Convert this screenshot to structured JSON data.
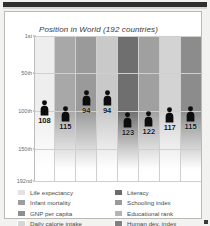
{
  "chart_data": {
    "type": "bar",
    "title": "Position in World (192 countries)",
    "xlabel": "",
    "ylabel": "",
    "ylim": [
      1,
      192
    ],
    "grid": true,
    "legend_position": "bottom",
    "ytick_labels": [
      "1st",
      "50th",
      "100th",
      "150th",
      "192nd"
    ],
    "ytick_values": [
      1,
      50,
      100,
      150,
      192
    ],
    "categories": [
      "Life expectancy",
      "Infant mortality",
      "GNP per capita",
      "Daily calorie intake",
      "Literacy",
      "Schooling index",
      "Educational rank",
      "Human dev. index"
    ],
    "values": [
      108,
      115,
      94,
      94,
      123,
      122,
      117,
      115
    ],
    "value_labels": [
      "108",
      "115",
      "94",
      "94",
      "123",
      "122",
      "117",
      "115"
    ],
    "band_colors": [
      "#eeeeee",
      "#a8a8a8",
      "#9a9a9a",
      "#c9c9c9",
      "#6f6f6f",
      "#a0a0a0",
      "#d3d3d3",
      "#8c8c8c"
    ]
  },
  "header": {
    "title": "Position in World (192 countries)"
  },
  "axis": {
    "ticks": [
      {
        "label": "1st",
        "value": 1
      },
      {
        "label": "50th",
        "value": 50
      },
      {
        "label": "100th",
        "value": 100
      },
      {
        "label": "150th",
        "value": 150
      },
      {
        "label": "192nd",
        "value": 192
      }
    ]
  },
  "series": [
    {
      "label": "Life expectancy",
      "value": 108,
      "value_label": "108",
      "color": "#eeeeee"
    },
    {
      "label": "Infant mortality",
      "value": 115,
      "value_label": "115",
      "color": "#a8a8a8"
    },
    {
      "label": "GNP per capita",
      "value": 94,
      "value_label": "94",
      "color": "#9a9a9a"
    },
    {
      "label": "Daily calorie intake",
      "value": 94,
      "value_label": "94",
      "color": "#c9c9c9"
    },
    {
      "label": "Literacy",
      "value": 123,
      "value_label": "123",
      "color": "#6f6f6f"
    },
    {
      "label": "Schooling index",
      "value": 122,
      "value_label": "122",
      "color": "#a0a0a0"
    },
    {
      "label": "Educational rank",
      "value": 117,
      "value_label": "117",
      "color": "#d3d3d3"
    },
    {
      "label": "Human dev. index",
      "value": 115,
      "value_label": "115",
      "color": "#8c8c8c"
    }
  ],
  "legend": {
    "left": [
      {
        "label": "Life expectancy",
        "color": "#e2e2e2"
      },
      {
        "label": "Infant mortality",
        "color": "#9d9d9d"
      },
      {
        "label": "GNP per capita",
        "color": "#8e8e8e"
      },
      {
        "label": "Daily calorie intake",
        "color": "#d5d5d5"
      }
    ],
    "right": [
      {
        "label": "Literacy",
        "color": "#6a6a6a"
      },
      {
        "label": "Schooling index",
        "color": "#999999"
      },
      {
        "label": "Educational rank",
        "color": "#b4b4b4"
      },
      {
        "label": "Human dev. index",
        "color": "#808080"
      }
    ]
  },
  "icons": {
    "person": "person-icon"
  }
}
